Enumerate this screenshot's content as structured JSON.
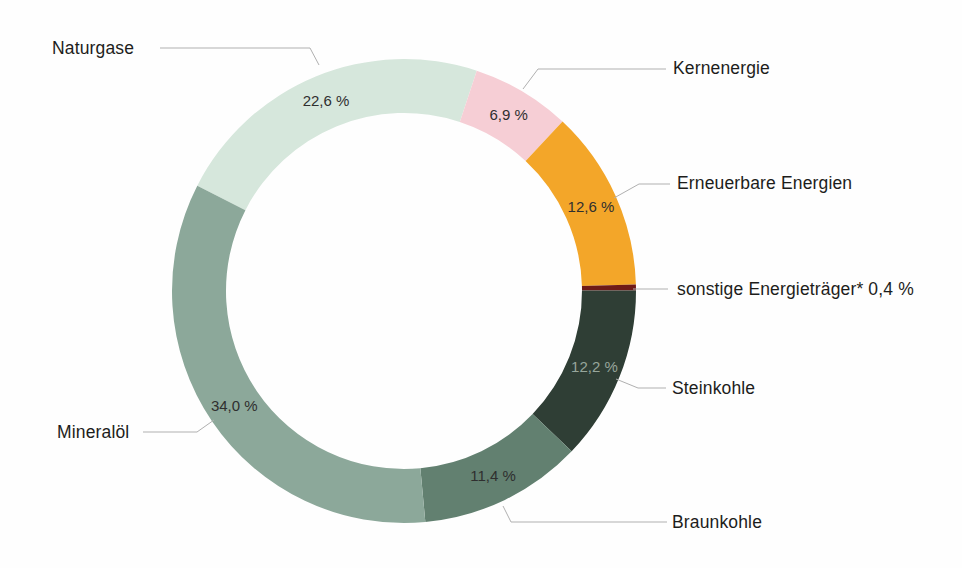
{
  "chart_data": {
    "type": "pie",
    "subtype": "donut",
    "title": "",
    "unit": "%",
    "direction": "clockwise",
    "start_angle_deg": -63,
    "legend_position": "none",
    "background_color": "#fefefe",
    "leader_line_color": "#b0b0b0",
    "value_label_color": "#2f2f2f",
    "segments": [
      {
        "label": "Naturgase",
        "value": 22.6,
        "display": "22,6 %",
        "color": "#d6e7dc",
        "show_value_in_ring": true,
        "value_text_color": "#2f2f2f"
      },
      {
        "label": "Kernenergie",
        "value": 6.9,
        "display": "6,9 %",
        "color": "#f6ced5",
        "show_value_in_ring": true,
        "value_text_color": "#2f2f2f"
      },
      {
        "label": "Erneuerbare Energien",
        "value": 12.6,
        "display": "12,6 %",
        "color": "#f3a629",
        "show_value_in_ring": true,
        "value_text_color": "#2f2f2f"
      },
      {
        "label": "sonstige Energieträger*",
        "value": 0.4,
        "display": "0,4 %",
        "color": "#6f1a17",
        "show_value_in_ring": false,
        "value_text_color": "#2f2f2f"
      },
      {
        "label": "Steinkohle",
        "value": 12.2,
        "display": "12,2 %",
        "color": "#2f3e35",
        "show_value_in_ring": true,
        "value_text_color": "#97a69b"
      },
      {
        "label": "Braunkohle",
        "value": 11.4,
        "display": "11,4 %",
        "color": "#628070",
        "show_value_in_ring": true,
        "value_text_color": "#2f2f2f"
      },
      {
        "label": "Mineralöl",
        "value": 34.0,
        "display": "34,0 %",
        "color": "#8ca89a",
        "show_value_in_ring": true,
        "value_text_color": "#2f2f2f"
      }
    ],
    "callouts": [
      {
        "text": "Naturgase",
        "pos": [
          52,
          38
        ],
        "leader": [
          [
            160,
            48
          ],
          [
            310,
            48
          ],
          [
            319,
            65
          ]
        ]
      },
      {
        "text": "Kernenergie",
        "pos": [
          673,
          58
        ],
        "leader": [
          [
            666,
            69
          ],
          [
            538,
            69
          ],
          [
            523,
            89
          ]
        ]
      },
      {
        "text": "Erneuerbare Energien",
        "pos": [
          677,
          173
        ],
        "leader": [
          [
            670,
            184
          ],
          [
            639,
            184
          ],
          [
            614,
            198
          ]
        ]
      },
      {
        "text": "sonstige Energieträger* 0,4 %",
        "pos": [
          677,
          279
        ],
        "leader": [
          [
            668,
            289
          ],
          [
            633,
            289
          ]
        ]
      },
      {
        "text": "Steinkohle",
        "pos": [
          672,
          378
        ],
        "leader": [
          [
            666,
            388
          ],
          [
            638,
            388
          ],
          [
            616,
            379
          ]
        ]
      },
      {
        "text": "Braunkohle",
        "pos": [
          672,
          512
        ],
        "leader": [
          [
            667,
            522
          ],
          [
            511,
            522
          ],
          [
            503,
            506
          ]
        ]
      },
      {
        "text": "Mineralöl",
        "pos": [
          57,
          422
        ],
        "leader": [
          [
            143,
            432
          ],
          [
            197,
            432
          ],
          [
            214,
            420
          ]
        ]
      }
    ]
  }
}
